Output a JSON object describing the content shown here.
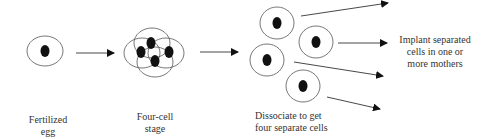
{
  "diagram": {
    "stages": [
      {
        "id": "fertilized-egg",
        "label_line1": "Fertilized",
        "label_line2": "egg"
      },
      {
        "id": "four-cell",
        "label_line1": "Four-cell",
        "label_line2": "stage"
      },
      {
        "id": "dissociate",
        "label_line1": "Dissociate to get",
        "label_line2": "four separate cells"
      },
      {
        "id": "implant",
        "label_line1": "Implant separated",
        "label_line2": "cells in one or",
        "label_line3": "more mothers"
      }
    ],
    "colors": {
      "stroke": "#444444",
      "nucleus": "#111111",
      "text": "#333333"
    }
  }
}
